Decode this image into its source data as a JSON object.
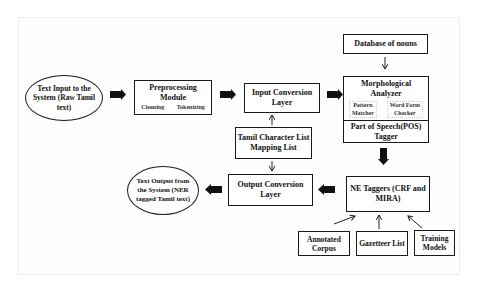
{
  "diagram": {
    "nodes": {
      "text_input": {
        "label": "Text Input to the System (Raw Tamil text)",
        "lines": [
          "Text Input to the",
          "System (Raw Tamil",
          "text)"
        ]
      },
      "preprocessing": {
        "title_lines": [
          "Preprocessing",
          "Module"
        ],
        "sub": [
          "Cleaning",
          "Tokenizing"
        ]
      },
      "input_conversion": {
        "lines": [
          "Input Conversion",
          "Layer"
        ]
      },
      "tamil_char_list": {
        "lines": [
          "Tamil Character List",
          "Mapping List"
        ]
      },
      "database_nouns": {
        "label": "Database of nouns"
      },
      "morph_analyzer": {
        "title_lines": [
          "Morphological",
          "Analyzer"
        ],
        "sub": [
          [
            "Pattern",
            "Matcher"
          ],
          [
            "Word Form",
            "Checker"
          ]
        ]
      },
      "pos_tagger": {
        "lines": [
          "Part of Speech(POS)",
          "Tagger"
        ]
      },
      "ne_taggers": {
        "lines": [
          "NE Taggers (CRF and",
          "MIRA)"
        ]
      },
      "output_conversion": {
        "lines": [
          "Output Conversion",
          "Layer"
        ]
      },
      "text_output": {
        "lines": [
          "Text Output from",
          "the System (NER",
          "tagged Tamil text)"
        ]
      },
      "annotated_corpus": {
        "lines": [
          "Annotated",
          "Corpus"
        ]
      },
      "gazetteer_list": {
        "label": "Gazetteer List"
      },
      "training_models": {
        "lines": [
          "Training",
          "Models"
        ]
      }
    },
    "edges": [
      {
        "from": "text_input",
        "to": "preprocessing",
        "style": "block"
      },
      {
        "from": "preprocessing",
        "to": "input_conversion",
        "style": "block"
      },
      {
        "from": "tamil_char_list",
        "to": "input_conversion",
        "style": "thin"
      },
      {
        "from": "input_conversion",
        "to": "morph_analyzer",
        "style": "block"
      },
      {
        "from": "database_nouns",
        "to": "morph_analyzer",
        "style": "thin"
      },
      {
        "from": "pos_tagger",
        "to": "ne_taggers",
        "style": "block"
      },
      {
        "from": "ne_taggers",
        "to": "output_conversion",
        "style": "block"
      },
      {
        "from": "tamil_char_list",
        "to": "output_conversion",
        "style": "thin"
      },
      {
        "from": "output_conversion",
        "to": "text_output",
        "style": "block"
      },
      {
        "from": "annotated_corpus",
        "to": "ne_taggers",
        "style": "thin"
      },
      {
        "from": "gazetteer_list",
        "to": "ne_taggers",
        "style": "thin"
      },
      {
        "from": "training_models",
        "to": "ne_taggers",
        "style": "thin"
      }
    ]
  }
}
